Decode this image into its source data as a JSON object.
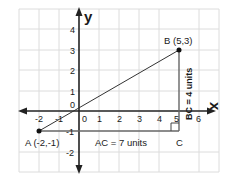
{
  "diagram": {
    "title": "",
    "axes": {
      "x_label": "x",
      "y_label": "y",
      "x_ticks": [
        "-2",
        "-1",
        "0",
        "1",
        "2",
        "3",
        "4",
        "5",
        "6"
      ],
      "y_ticks": [
        "4",
        "3",
        "2",
        "1",
        "-1",
        "-2"
      ],
      "origin_label": "0"
    },
    "points": {
      "A": {
        "label": "A (-2,-1)",
        "x": -2,
        "y": -1
      },
      "B": {
        "label": "B (5,3)",
        "x": 5,
        "y": 3
      },
      "C": {
        "label": "C",
        "x": 5,
        "y": -1
      }
    },
    "annotations": {
      "ac": "AC = 7 units",
      "bc": "BC = 4 units"
    },
    "colors": {
      "grid": "#dcdcdc",
      "axis": "#222222",
      "line": "#333333",
      "point": "#111111"
    }
  }
}
